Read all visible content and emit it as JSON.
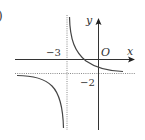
{
  "figure": {
    "panel_label": ")",
    "axes": {
      "x_label": "x",
      "y_label": "y",
      "origin_label": "O"
    },
    "asymptotes": {
      "vertical": {
        "value": -3,
        "label": "−3"
      },
      "horizontal": {
        "value": -2,
        "label": "−2"
      }
    },
    "curve": {
      "type": "hyperbola",
      "description": "Two branches: upper-right of (-3,-2) and lower-left of (-3,-2)"
    },
    "colors": {
      "axis": "#333333",
      "curve": "#444444",
      "asymptote": "#888888"
    }
  }
}
